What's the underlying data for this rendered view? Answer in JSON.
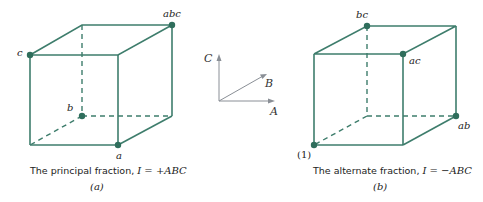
{
  "colors": {
    "edge": "#3e7d6c",
    "vertex": "#2f6e5c",
    "axis": "#8a8f96",
    "text": "#222222"
  },
  "panel_a": {
    "vertex_labels": {
      "c": "c",
      "abc": "abc",
      "b": "b",
      "a": "a"
    },
    "caption_text": "The principal fraction, ",
    "caption_formula": "I = +ABC",
    "sublabel": "(a)"
  },
  "axes": {
    "labels": {
      "C": "C",
      "B": "B",
      "A": "A"
    }
  },
  "panel_b": {
    "vertex_labels": {
      "bc": "bc",
      "ac": "ac",
      "ab": "ab",
      "one": "(1)"
    },
    "caption_text": "The alternate fraction, ",
    "caption_formula": "I = −ABC",
    "sublabel": "(b)"
  }
}
